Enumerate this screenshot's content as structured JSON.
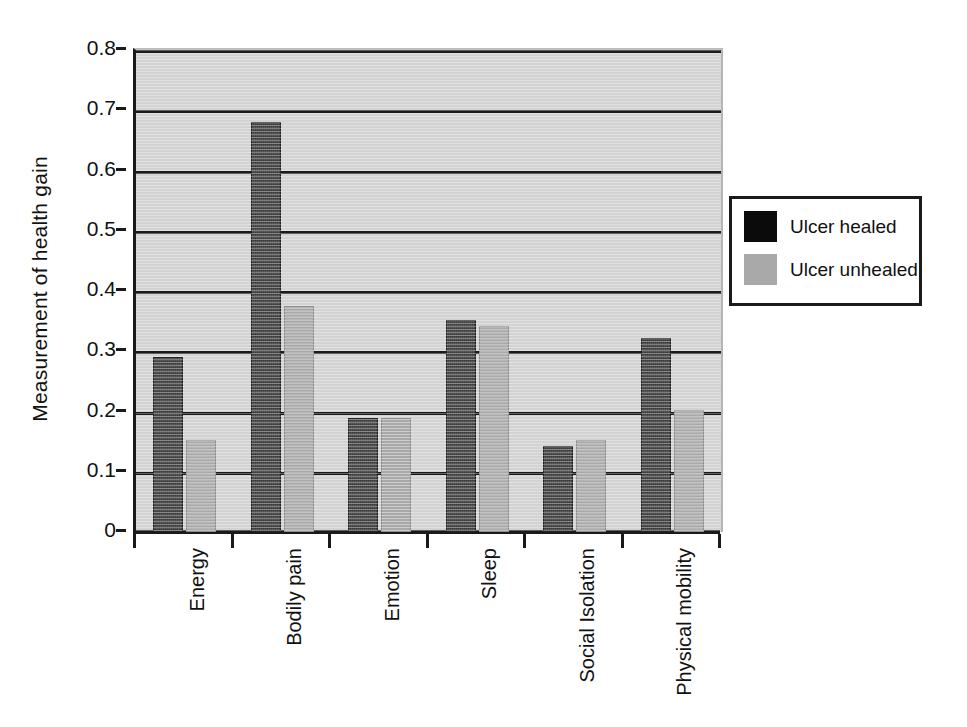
{
  "chart_data": {
    "type": "bar",
    "title": "",
    "subtitle": "",
    "xlabel": "",
    "ylabel": "Measurement of health gain",
    "ylim": [
      0,
      0.8
    ],
    "ytick_labels": [
      "0",
      "0.1",
      "0.2",
      "0.3",
      "0.4",
      "0.5",
      "0.6",
      "0.7",
      "0.8"
    ],
    "ytick_values": [
      0,
      0.1,
      0.2,
      0.3,
      0.4,
      0.5,
      0.6,
      0.7,
      0.8
    ],
    "grid": true,
    "grid_axis": "y",
    "legend_position": "right",
    "categories": [
      "Energy",
      "Bodily pain",
      "Emotion",
      "Sleep",
      "Social Isolation",
      "Physical mobility"
    ],
    "series": [
      {
        "name": "Ulcer healed",
        "color": "#3b3b3b",
        "values": [
          0.29,
          0.68,
          0.19,
          0.352,
          0.142,
          0.322
        ]
      },
      {
        "name": "Ulcer unhealed",
        "color": "#a9a9a9",
        "values": [
          0.152,
          0.375,
          0.19,
          0.342,
          0.153,
          0.202
        ]
      }
    ]
  },
  "legend": {
    "entries": [
      {
        "label": "Ulcer healed",
        "swatch": "healed"
      },
      {
        "label": "Ulcer unhealed",
        "swatch": "unhealed"
      }
    ]
  },
  "colors": {
    "plot_background": "#d3d3d3",
    "axis": "#1a1a1a",
    "grid": "#1a1a1a",
    "healed": "#3b3b3b",
    "unhealed": "#a9a9a9",
    "text": "#111111"
  }
}
